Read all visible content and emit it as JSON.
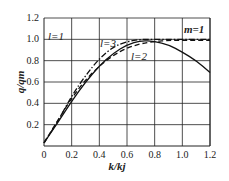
{
  "chart_data": {
    "type": "line",
    "title": "",
    "xlabel": "k/kj",
    "ylabel": "q/qm",
    "xlim": [
      0,
      1.2
    ],
    "ylim": [
      0,
      1.2
    ],
    "grid": true,
    "x_ticks": [
      "0",
      "0.2",
      "0.4",
      "0.6",
      "0.8",
      "1.0",
      "1.2"
    ],
    "y_ticks": [
      "0.2",
      "0.4",
      "0.6",
      "0.8",
      "1.0",
      "1.2"
    ],
    "annotations": [
      "l=1",
      "l=2",
      "l=3",
      "m=1"
    ],
    "series": [
      {
        "name": "l=1",
        "style": "solid",
        "x": [
          0,
          0.1,
          0.2,
          0.3,
          0.4,
          0.5,
          0.6,
          0.7,
          0.8,
          0.9,
          1.0,
          1.1,
          1.2
        ],
        "y": [
          0.03,
          0.22,
          0.42,
          0.6,
          0.75,
          0.87,
          0.95,
          0.99,
          0.98,
          0.95,
          0.88,
          0.8,
          0.69
        ]
      },
      {
        "name": "l=2",
        "style": "dashed",
        "x": [
          0,
          0.1,
          0.2,
          0.3,
          0.4,
          0.5,
          0.6,
          0.7,
          0.8,
          0.9,
          1.0,
          1.1,
          1.2
        ],
        "y": [
          0.03,
          0.24,
          0.45,
          0.62,
          0.75,
          0.85,
          0.92,
          0.96,
          0.98,
          0.99,
          0.99,
          0.99,
          0.99
        ]
      },
      {
        "name": "l=3",
        "style": "dashdot",
        "x": [
          0,
          0.1,
          0.2,
          0.3,
          0.4,
          0.5,
          0.6,
          0.7,
          0.8,
          0.9,
          1.0,
          1.1,
          1.2
        ],
        "y": [
          0.03,
          0.23,
          0.47,
          0.66,
          0.82,
          0.93,
          0.98,
          1.0,
          1.0,
          1.0,
          1.0,
          1.0,
          1.0
        ]
      }
    ]
  },
  "labels": {
    "x_axis": "k/kj",
    "y_axis": "q/qm",
    "l1": "l=1",
    "l2": "l=2",
    "l3": "l=3",
    "m1": "m=1"
  }
}
